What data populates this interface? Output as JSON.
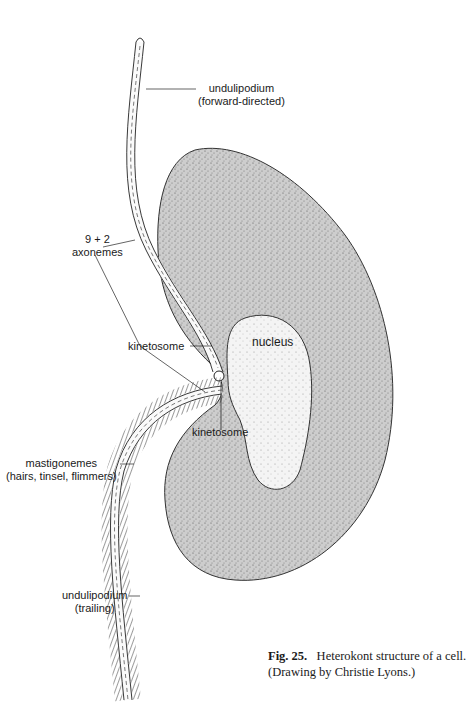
{
  "figure": {
    "number_label": "Fig. 25.",
    "caption_text": "Heterokont structure of a cell.",
    "credit": "(Drawing by Christie Lyons.)"
  },
  "labels": {
    "undulipodium_forward": {
      "line1": "undulipodium",
      "line2": "(forward-directed)"
    },
    "axonemes": {
      "line1": "9 + 2",
      "line2": "axonemes"
    },
    "kinetosome_upper": "kinetosome",
    "nucleus": "nucleus",
    "kinetosome_lower": "kinetosome",
    "mastigonemes": {
      "line1": "mastigonemes",
      "line2": "(hairs, tinsel, flimmers)"
    },
    "undulipodium_trailing": {
      "line1": "undulipodium",
      "line2": "(trailing)"
    }
  },
  "colors": {
    "ink": "#1a1a1a",
    "cell_fill": "#c9c9c9",
    "nucleus_fill": "#f2f2f2",
    "background": "#ffffff"
  }
}
